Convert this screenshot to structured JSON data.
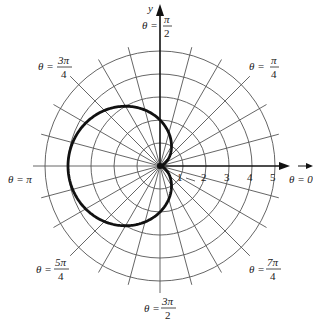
{
  "chart_data": {
    "type": "polar",
    "title": "",
    "equation": "r = 2 - 2cos(θ)",
    "center_px": [
      160,
      166
    ],
    "unit_px": 23,
    "grid": {
      "circles": [
        1,
        2,
        3,
        4,
        5
      ],
      "ray_step": "π/12"
    },
    "axes": {
      "y_label": "y",
      "x_tick_labels": [
        "1",
        "2",
        "3",
        "4",
        "5"
      ]
    },
    "angle_labels": [
      {
        "id": "pi_over_2",
        "prefix": "θ =",
        "num": "π",
        "den": "2"
      },
      {
        "id": "pi_over_4",
        "prefix": "θ =",
        "num": "π",
        "den": "4"
      },
      {
        "id": "three_pi_over_4",
        "prefix": "θ =",
        "num": "3π",
        "den": "4"
      },
      {
        "id": "pi",
        "text": "θ = π"
      },
      {
        "id": "zero",
        "text": "θ = 0"
      },
      {
        "id": "five_pi_over_4",
        "prefix": "θ =",
        "num": "5π",
        "den": "4"
      },
      {
        "id": "three_pi_over_2",
        "prefix": "θ =",
        "num": "3π",
        "den": "2"
      },
      {
        "id": "seven_pi_over_4",
        "prefix": "θ =",
        "num": "7π",
        "den": "4"
      }
    ],
    "curve_samples": [
      {
        "theta_deg": 0,
        "r": 0
      },
      {
        "theta_deg": 45,
        "r": 0.59
      },
      {
        "theta_deg": 90,
        "r": 2
      },
      {
        "theta_deg": 135,
        "r": 3.41
      },
      {
        "theta_deg": 180,
        "r": 4
      },
      {
        "theta_deg": 225,
        "r": 3.41
      },
      {
        "theta_deg": 270,
        "r": 2
      },
      {
        "theta_deg": 315,
        "r": 0.59
      }
    ]
  },
  "labels": {
    "y_axis": "y",
    "ticks": [
      "1",
      "2",
      "3",
      "4",
      "5"
    ],
    "theta_prefix": "θ =",
    "pi2_num": "π",
    "pi2_den": "2",
    "pi4_num": "π",
    "pi4_den": "4",
    "3pi4_num": "3π",
    "3pi4_den": "4",
    "pi_text": "θ = π",
    "zero_text": "θ = 0",
    "5pi4_num": "5π",
    "5pi4_den": "4",
    "3pi2_num": "3π",
    "3pi2_den": "2",
    "7pi4_num": "7π",
    "7pi4_den": "4"
  },
  "colors": {
    "grid": "#555555",
    "curve": "#111111",
    "background": "#ffffff"
  }
}
